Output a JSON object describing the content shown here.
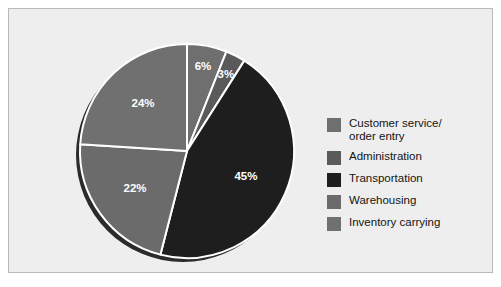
{
  "figure": {
    "background": "#ffffff",
    "panel_background": "#eeeeee",
    "panel_border": "#b9b9b9"
  },
  "legend": {
    "items": [
      {
        "label": "Customer service/\norder entry",
        "color": "#6f6f6f"
      },
      {
        "label": "Administration",
        "color": "#5a5a5a"
      },
      {
        "label": "Transportation",
        "color": "#1e1e1e"
      },
      {
        "label": "Warehousing",
        "color": "#6b6b6b"
      },
      {
        "label": "Inventory carrying",
        "color": "#707070"
      }
    ]
  },
  "chart_data": {
    "type": "pie",
    "title": "",
    "labels": [
      "Customer service/order entry",
      "Administration",
      "Transportation",
      "Warehousing",
      "Inventory carrying"
    ],
    "values": [
      6,
      3,
      45,
      22,
      24
    ],
    "value_labels": [
      "6%",
      "3%",
      "45%",
      "22%",
      "24%"
    ],
    "colors": [
      "#6f6f6f",
      "#5a5a5a",
      "#1e1e1e",
      "#6b6b6b",
      "#707070"
    ],
    "units": "percent",
    "total": 100,
    "start_angle_deg": 0,
    "direction": "clockwise",
    "separator_color": "#ffffff",
    "label_color": "#ffffff",
    "shadow_color": "#2b2b2b",
    "legend_position": "right",
    "slices": [
      {
        "label": "Customer service/order entry",
        "value": 6,
        "display": "6%",
        "color": "#6f6f6f"
      },
      {
        "label": "Administration",
        "value": 3,
        "display": "3%",
        "color": "#5a5a5a"
      },
      {
        "label": "Transportation",
        "value": 45,
        "display": "45%",
        "color": "#1e1e1e"
      },
      {
        "label": "Warehousing",
        "value": 22,
        "display": "22%",
        "color": "#6b6b6b"
      },
      {
        "label": "Inventory carrying",
        "value": 24,
        "display": "24%",
        "color": "#707070"
      }
    ]
  }
}
